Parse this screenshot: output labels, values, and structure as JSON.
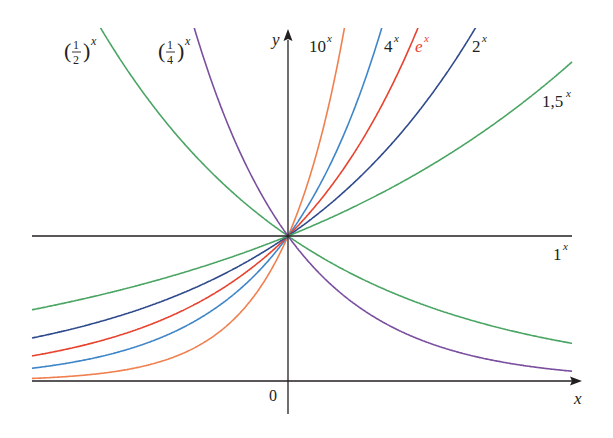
{
  "chart_data": {
    "type": "line",
    "title": "",
    "xlabel": "x",
    "ylabel": "y",
    "origin_label": "0",
    "xlim": [
      -1.75,
      1.95
    ],
    "ylim": [
      -0.25,
      2.6
    ],
    "grid": false,
    "legend": "inline labels at curve ends",
    "series": [
      {
        "name": "(1/2)^x",
        "base": 0.5,
        "color": "#4aa564",
        "label": "(½)ˣ"
      },
      {
        "name": "(1/4)^x",
        "base": 0.25,
        "color": "#7b4fa0",
        "label": "(¼)ˣ"
      },
      {
        "name": "10^x",
        "base": 10,
        "color": "#f08050",
        "label": "10ˣ"
      },
      {
        "name": "4^x",
        "base": 4,
        "color": "#3f86c9",
        "label": "4ˣ"
      },
      {
        "name": "e^x",
        "base": 2.71828,
        "color": "#e8432f",
        "label": "eˣ"
      },
      {
        "name": "2^x",
        "base": 2,
        "color": "#2e4a8c",
        "label": "2ˣ"
      },
      {
        "name": "1.5^x",
        "base": 1.5,
        "color": "#4aa564",
        "label": "1,5ˣ"
      },
      {
        "name": "1^x",
        "base": 1,
        "color": "#231f20",
        "label": "1ˣ"
      }
    ],
    "annotations": [
      "(1/2)^x",
      "(1/4)^x",
      "10^x",
      "4^x",
      "e^x",
      "2^x",
      "1,5^x",
      "1^x",
      "0",
      "x",
      "y"
    ]
  },
  "labels": {
    "half": {
      "base": "(",
      "num": "1",
      "den": "2",
      "close": ")",
      "exp": "x"
    },
    "quarter": {
      "base": "(",
      "num": "1",
      "den": "4",
      "close": ")",
      "exp": "x"
    },
    "ten": {
      "base": "10",
      "exp": "x"
    },
    "four": {
      "base": "4",
      "exp": "x"
    },
    "e": {
      "base": "e",
      "exp": "x"
    },
    "two": {
      "base": "2",
      "exp": "x"
    },
    "onefive": {
      "base": "1,5",
      "exp": "x"
    },
    "one": {
      "base": "1",
      "exp": "x"
    },
    "origin": "0",
    "x_axis": "x",
    "y_axis": "y"
  }
}
